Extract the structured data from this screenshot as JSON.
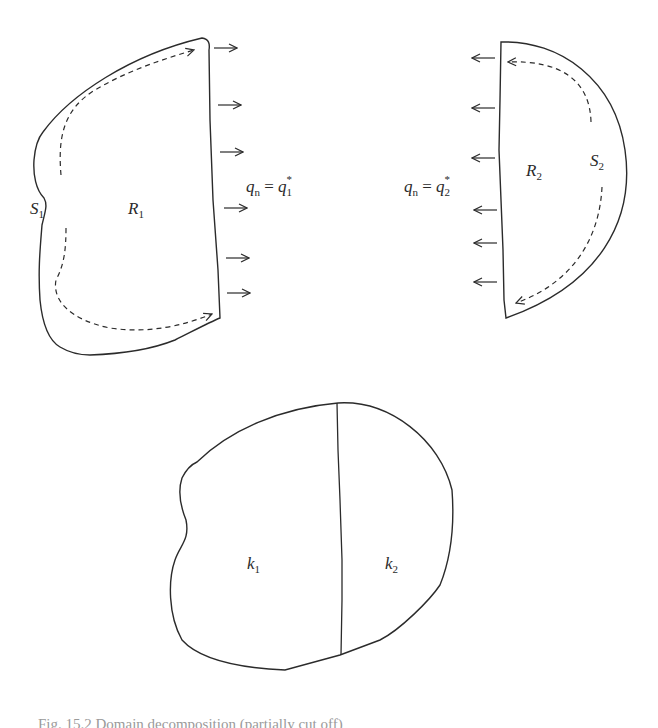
{
  "figure": {
    "top_left": {
      "region_label": "R",
      "region_sub": "1",
      "boundary_label": "S",
      "boundary_sub": "1",
      "flux_label_lhs": "q",
      "flux_label_lhs_sub": "n",
      "flux_label_eq": " = ",
      "flux_label_rhs": "q",
      "flux_label_rhs_sub": "1",
      "flux_label_rhs_sup": "*",
      "arrow_direction": "right",
      "arrow_count": 6
    },
    "top_right": {
      "region_label": "R",
      "region_sub": "2",
      "boundary_label": "S",
      "boundary_sub": "2",
      "flux_label_lhs": "q",
      "flux_label_lhs_sub": "n",
      "flux_label_eq": " = ",
      "flux_label_rhs": "q",
      "flux_label_rhs_sub": "2",
      "flux_label_rhs_sup": "*",
      "arrow_direction": "left",
      "arrow_count": 6
    },
    "bottom": {
      "left_label": "k",
      "left_sub": "1",
      "right_label": "k",
      "right_sub": "2"
    },
    "caption": "Fig. 15.2 Domain decomposition (partially cut off)"
  },
  "colors": {
    "stroke": "#2b2b2b",
    "text": "#2a2a2a",
    "background": "#ffffff"
  }
}
